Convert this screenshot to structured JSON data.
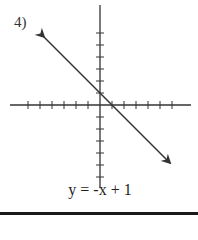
{
  "problem": {
    "number_label": "4)",
    "equation": "y = -x + 1"
  },
  "chart_data": {
    "type": "line",
    "title": "",
    "equation": "y = -x + 1",
    "slope": -1,
    "y_intercept": 1,
    "x_intercept": 1,
    "xlabel": "",
    "ylabel": "",
    "xlim": [
      -7.5,
      7.6
    ],
    "ylim": [
      -6.9,
      8.3
    ],
    "x_ticks": [
      -6,
      -5,
      -4,
      -3,
      -2,
      -1,
      1,
      2,
      3,
      4,
      5,
      6
    ],
    "y_ticks": [
      -6,
      -5,
      -4,
      -3,
      -2,
      -1,
      1,
      2,
      3,
      4,
      5,
      6
    ],
    "tick_labels_shown": false,
    "grid": false,
    "legend": null,
    "series": [
      {
        "name": "y = -x + 1",
        "x": [
          -4.67,
          5.83
        ],
        "y": [
          5.67,
          -4.83
        ],
        "arrows_both_ends": true
      }
    ]
  },
  "colors": {
    "axis": "#333333",
    "line": "#333333",
    "rule": "#1a1a1a"
  }
}
